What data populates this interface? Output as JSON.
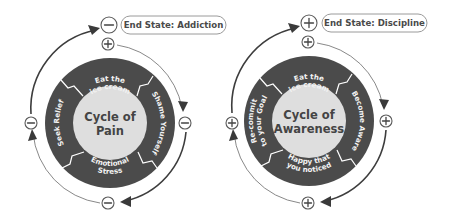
{
  "diagrams": [
    {
      "id": "pain",
      "title_line1": "Cycle of",
      "title_line2": "Pain",
      "end_state": "End State: Addiction",
      "end_marker": "minus",
      "marker": "minus",
      "segments": [
        {
          "line1": "Eat the",
          "line2": "ice cream"
        },
        {
          "line1": "Shame Yourself",
          "line2": ""
        },
        {
          "line1": "Emotional",
          "line2": "Stress"
        },
        {
          "line1": "Seek Relief",
          "line2": ""
        }
      ]
    },
    {
      "id": "awareness",
      "title_line1": "Cycle of",
      "title_line2": "Awareness",
      "end_state": "End State: Discipline",
      "end_marker": "plus",
      "marker": "plus",
      "segments": [
        {
          "line1": "Eat the",
          "line2": "ice cream"
        },
        {
          "line1": "Become Aware",
          "line2": ""
        },
        {
          "line1": "Happy that",
          "line2": "you noticed"
        },
        {
          "line1": "Re-commit",
          "line2": "to your Goal"
        }
      ]
    }
  ],
  "colors": {
    "ring": "#4b4b4b",
    "center": "#dedede",
    "divider": "#ffffff",
    "arrow": "#3a3a3a"
  }
}
